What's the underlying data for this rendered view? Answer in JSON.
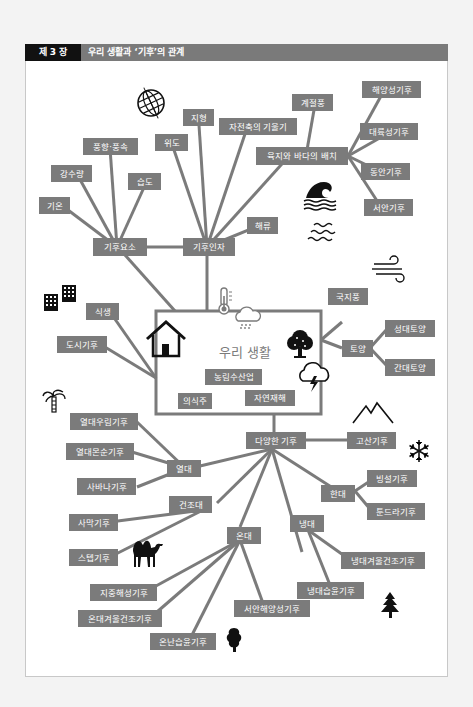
{
  "header": {
    "chapter": "제 3 장",
    "title": "우리 생활과 ‘기후’의 관계"
  },
  "colors": {
    "node_fill": "#7b7b7b",
    "node_text": "#ffffff",
    "header_chapter_bg": "#111111",
    "header_bar_bg": "#7a7a7a",
    "page_bg": "#f3f3f3"
  },
  "center": {
    "title": "우리 생활",
    "items": [
      "농림수산업",
      "의식주",
      "자연재해"
    ]
  },
  "nodes": {
    "climate_elements": "기후요소",
    "climate_factors": "기후인자",
    "temperature": "기온",
    "precipitation": "강수량",
    "wind": "풍향·풍속",
    "humidity": "습도",
    "latitude": "위도",
    "terrain": "지형",
    "axial_tilt": "자전축의 기울기",
    "monsoon": "계절풍",
    "land_sea": "육지와 바다의 배치",
    "oceanic": "해양성기후",
    "continental": "대륙성기후",
    "east_coast": "동안기후",
    "west_coast": "서안기후",
    "ocean_current": "해류",
    "vegetation": "식생",
    "urban": "도시기후",
    "local_wind": "국지풍",
    "soil": "토양",
    "zonal_soil": "성대토양",
    "intrazonal_soil": "간대토양",
    "diverse": "다양한 기후",
    "highland": "고산기후",
    "tropical": "열대",
    "rainforest": "열대우림기후",
    "tropical_monsoon": "열대몬순기후",
    "savanna": "사바나기후",
    "arid": "건조대",
    "desert": "사막기후",
    "steppe": "스텝기후",
    "temperate": "온대",
    "mediterranean": "지중해성기후",
    "temperate_winter_dry": "온대겨울건조기후",
    "humid_subtropical": "온난습윤기후",
    "marine_west_coast": "서안해양성기후",
    "subarctic": "냉대",
    "subarctic_winter_dry": "냉대겨울건조기후",
    "subarctic_humid": "냉대습윤기후",
    "polar": "한대",
    "ice_cap": "빙설기후",
    "tundra": "툰드라기후"
  },
  "icons": [
    "globe-icon",
    "tsunami-wave-icon",
    "water-waves-icon",
    "wind-icon",
    "buildings-icon",
    "thermometer-icon",
    "rain-cloud-icon",
    "house-icon",
    "tree-icon",
    "storm-cloud-icon",
    "palm-tree-icon",
    "mountain-icon",
    "snowflake-icon",
    "camel-icon",
    "round-tree-icon",
    "pine-tree-icon"
  ]
}
